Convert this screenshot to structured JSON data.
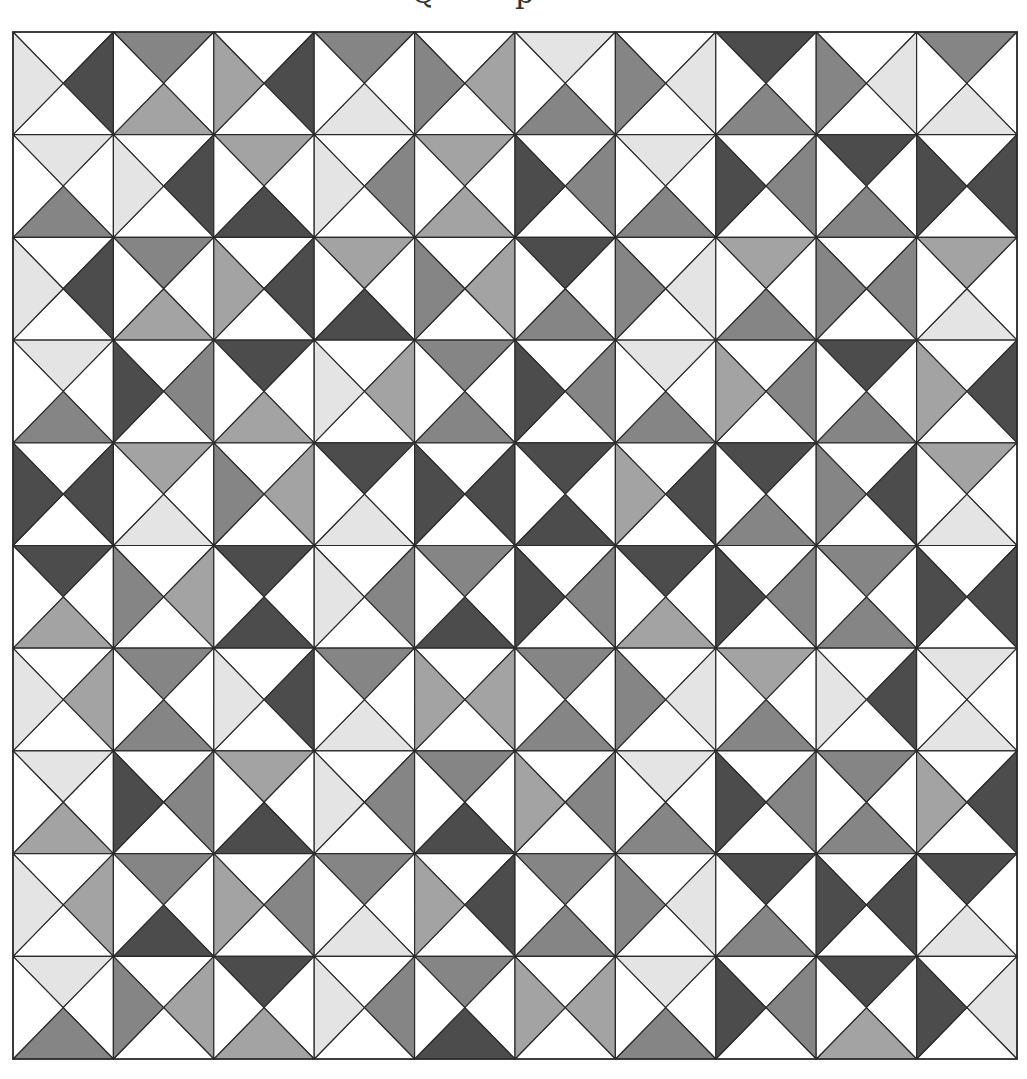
{
  "title": {
    "visible_fragments": [
      "Q",
      "p"
    ],
    "note_clipped": true
  },
  "palette": {
    "W": "#ffffff",
    "L": "#e4e4e4",
    "M": "#a3a3a3",
    "G": "#858585",
    "D": "#4c4c4c",
    "stroke": "#2a2a2a"
  },
  "grid": {
    "rows": 10,
    "cols": 10,
    "cell_order": "top,right,bottom,left",
    "cells": [
      [
        [
          "W",
          "D",
          "W",
          "L"
        ],
        [
          "G",
          "W",
          "M",
          "W"
        ],
        [
          "W",
          "D",
          "W",
          "M"
        ],
        [
          "G",
          "W",
          "L",
          "W"
        ],
        [
          "W",
          "M",
          "W",
          "G"
        ],
        [
          "L",
          "W",
          "G",
          "W"
        ],
        [
          "W",
          "L",
          "W",
          "G"
        ],
        [
          "D",
          "W",
          "G",
          "W"
        ],
        [
          "W",
          "L",
          "W",
          "G"
        ],
        [
          "G",
          "W",
          "L",
          "W"
        ]
      ],
      [
        [
          "L",
          "W",
          "G",
          "W"
        ],
        [
          "W",
          "D",
          "W",
          "L"
        ],
        [
          "M",
          "W",
          "D",
          "W"
        ],
        [
          "W",
          "G",
          "W",
          "L"
        ],
        [
          "M",
          "W",
          "M",
          "W"
        ],
        [
          "W",
          "G",
          "W",
          "D"
        ],
        [
          "L",
          "W",
          "G",
          "W"
        ],
        [
          "W",
          "G",
          "W",
          "D"
        ],
        [
          "D",
          "W",
          "G",
          "W"
        ],
        [
          "W",
          "D",
          "W",
          "D"
        ]
      ],
      [
        [
          "W",
          "D",
          "W",
          "L"
        ],
        [
          "G",
          "W",
          "M",
          "W"
        ],
        [
          "W",
          "D",
          "W",
          "M"
        ],
        [
          "M",
          "W",
          "D",
          "W"
        ],
        [
          "W",
          "M",
          "W",
          "G"
        ],
        [
          "D",
          "W",
          "G",
          "W"
        ],
        [
          "W",
          "L",
          "W",
          "G"
        ],
        [
          "M",
          "W",
          "G",
          "W"
        ],
        [
          "W",
          "G",
          "W",
          "G"
        ],
        [
          "M",
          "W",
          "L",
          "W"
        ]
      ],
      [
        [
          "L",
          "W",
          "G",
          "W"
        ],
        [
          "W",
          "G",
          "W",
          "D"
        ],
        [
          "D",
          "W",
          "M",
          "W"
        ],
        [
          "W",
          "M",
          "W",
          "L"
        ],
        [
          "G",
          "W",
          "G",
          "W"
        ],
        [
          "W",
          "G",
          "W",
          "D"
        ],
        [
          "L",
          "W",
          "G",
          "W"
        ],
        [
          "W",
          "G",
          "W",
          "M"
        ],
        [
          "D",
          "W",
          "G",
          "W"
        ],
        [
          "W",
          "D",
          "W",
          "M"
        ]
      ],
      [
        [
          "W",
          "D",
          "W",
          "D"
        ],
        [
          "M",
          "W",
          "L",
          "W"
        ],
        [
          "W",
          "M",
          "W",
          "G"
        ],
        [
          "D",
          "W",
          "L",
          "W"
        ],
        [
          "W",
          "D",
          "W",
          "D"
        ],
        [
          "D",
          "W",
          "D",
          "W"
        ],
        [
          "W",
          "D",
          "W",
          "M"
        ],
        [
          "D",
          "W",
          "G",
          "W"
        ],
        [
          "W",
          "D",
          "W",
          "G"
        ],
        [
          "M",
          "W",
          "L",
          "W"
        ]
      ],
      [
        [
          "D",
          "W",
          "M",
          "W"
        ],
        [
          "W",
          "M",
          "W",
          "G"
        ],
        [
          "D",
          "W",
          "D",
          "W"
        ],
        [
          "W",
          "G",
          "W",
          "L"
        ],
        [
          "G",
          "W",
          "D",
          "W"
        ],
        [
          "W",
          "G",
          "W",
          "D"
        ],
        [
          "D",
          "W",
          "M",
          "W"
        ],
        [
          "W",
          "G",
          "W",
          "D"
        ],
        [
          "G",
          "W",
          "G",
          "W"
        ],
        [
          "W",
          "D",
          "W",
          "D"
        ]
      ],
      [
        [
          "W",
          "M",
          "W",
          "L"
        ],
        [
          "G",
          "W",
          "G",
          "W"
        ],
        [
          "W",
          "D",
          "W",
          "L"
        ],
        [
          "G",
          "W",
          "L",
          "W"
        ],
        [
          "W",
          "M",
          "W",
          "M"
        ],
        [
          "G",
          "W",
          "G",
          "W"
        ],
        [
          "W",
          "L",
          "W",
          "G"
        ],
        [
          "M",
          "W",
          "G",
          "W"
        ],
        [
          "W",
          "D",
          "W",
          "L"
        ],
        [
          "L",
          "W",
          "L",
          "W"
        ]
      ],
      [
        [
          "L",
          "W",
          "M",
          "W"
        ],
        [
          "W",
          "G",
          "W",
          "D"
        ],
        [
          "M",
          "W",
          "D",
          "W"
        ],
        [
          "W",
          "G",
          "W",
          "L"
        ],
        [
          "G",
          "W",
          "D",
          "W"
        ],
        [
          "W",
          "G",
          "W",
          "M"
        ],
        [
          "L",
          "W",
          "G",
          "W"
        ],
        [
          "W",
          "G",
          "W",
          "D"
        ],
        [
          "G",
          "W",
          "G",
          "W"
        ],
        [
          "W",
          "D",
          "W",
          "M"
        ]
      ],
      [
        [
          "W",
          "M",
          "W",
          "L"
        ],
        [
          "G",
          "W",
          "D",
          "W"
        ],
        [
          "W",
          "G",
          "W",
          "M"
        ],
        [
          "G",
          "W",
          "L",
          "W"
        ],
        [
          "W",
          "D",
          "W",
          "M"
        ],
        [
          "G",
          "W",
          "G",
          "W"
        ],
        [
          "W",
          "L",
          "W",
          "G"
        ],
        [
          "D",
          "W",
          "G",
          "W"
        ],
        [
          "W",
          "D",
          "W",
          "D"
        ],
        [
          "D",
          "W",
          "L",
          "W"
        ]
      ],
      [
        [
          "L",
          "W",
          "G",
          "W"
        ],
        [
          "W",
          "M",
          "W",
          "G"
        ],
        [
          "D",
          "W",
          "M",
          "W"
        ],
        [
          "W",
          "G",
          "W",
          "L"
        ],
        [
          "G",
          "W",
          "D",
          "W"
        ],
        [
          "W",
          "M",
          "W",
          "M"
        ],
        [
          "L",
          "W",
          "G",
          "W"
        ],
        [
          "W",
          "G",
          "W",
          "D"
        ],
        [
          "D",
          "W",
          "M",
          "W"
        ],
        [
          "W",
          "L",
          "W",
          "D"
        ]
      ]
    ]
  }
}
